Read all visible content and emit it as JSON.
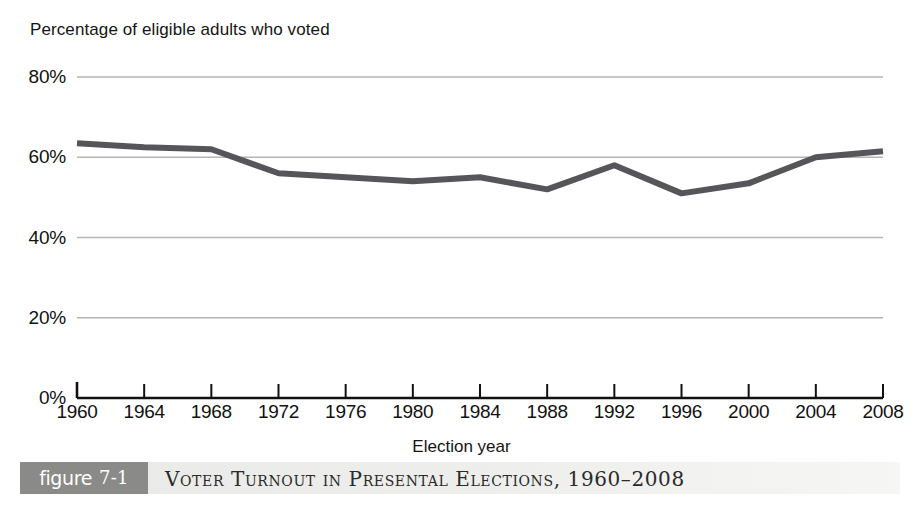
{
  "figure": {
    "badge_word": "figure",
    "badge_number": "7-1",
    "caption": "Voter Turnout in Presental Elections, 1960–2008"
  },
  "chart_data": {
    "type": "line",
    "title": "",
    "ylabel": "Percentage of eligible adults who voted",
    "xlabel": "Election year",
    "categories": [
      "1960",
      "1964",
      "1968",
      "1972",
      "1976",
      "1980",
      "1984",
      "1988",
      "1992",
      "1996",
      "2000",
      "2004",
      "2008"
    ],
    "values": [
      63.5,
      62.5,
      62,
      56,
      55,
      54,
      55,
      52,
      58,
      51,
      53.5,
      60,
      61.5
    ],
    "series": [
      {
        "name": "Percentage of eligible adults who voted",
        "values": [
          63.5,
          62.5,
          62,
          56,
          55,
          54,
          55,
          52,
          58,
          51,
          53.5,
          60,
          61.5
        ]
      }
    ],
    "ylim": [
      0,
      80
    ],
    "yticks": [
      0,
      20,
      40,
      60,
      80
    ],
    "ytick_labels": [
      "0%",
      "20%",
      "40%",
      "60%",
      "80%"
    ],
    "xtick_labels": [
      "1960",
      "1964",
      "1968",
      "1972",
      "1976",
      "1980",
      "1984",
      "1988",
      "1992",
      "1996",
      "2000",
      "2004",
      "2008"
    ],
    "grid": "horizontal",
    "legend": "none",
    "line_color": "#56565a",
    "grid_color": "#b5b5b5",
    "axis_color": "#111111"
  }
}
